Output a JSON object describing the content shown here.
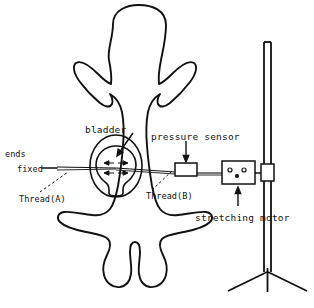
{
  "figure": {
    "type": "line-diagram",
    "background_color": "#ffffff",
    "line_color": "#111111"
  },
  "labels": {
    "bladder": "bladder",
    "pressure_sensor": "pressure sensor",
    "ends": "ends",
    "fixed": "fixed",
    "thread_a": "Thread(A)",
    "thread_b": "Thread(B)",
    "stretching_motor": "stretching motor"
  },
  "parts": {
    "animal_outline": "frog-body-outline",
    "bladder_outer": "bladder-outer-oval",
    "bladder_inner": "bladder-inner-oval",
    "sensor_box": "pressure-sensor-box",
    "motor_box": "stretching-motor-box",
    "stand_pole": "stand-pole",
    "stand_base": "stand-tripod-base",
    "thread_a_line": "thread-a-line",
    "thread_b_line": "thread-b-line"
  }
}
